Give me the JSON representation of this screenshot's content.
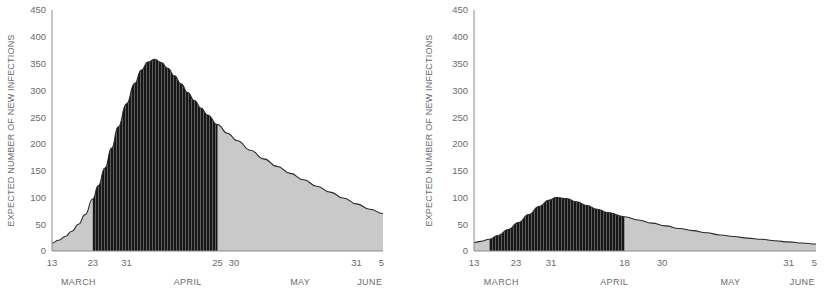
{
  "figure": {
    "panel_count": 2,
    "colors": {
      "light_fill": "#c9c9c9",
      "dark_fill": "#1e1e1e",
      "curve_stroke": "#2b2b2b",
      "axis_stroke": "#8a8a8a",
      "text": "#6b6b6b",
      "background": "#ffffff"
    }
  },
  "chart_data": [
    {
      "id": "left-panel",
      "type": "area",
      "title": "",
      "xlabel": "",
      "ylabel": "EXPECTED NUMBER OF NEW INFECTIONS",
      "ylim": [
        0,
        450
      ],
      "yticks": [
        0,
        50,
        100,
        150,
        200,
        250,
        300,
        350,
        400,
        450
      ],
      "ytick_labels": [
        "0",
        "50",
        "100",
        "150",
        "200",
        "250",
        "300",
        "350",
        "400",
        "450"
      ],
      "grid": false,
      "legend": "none",
      "xlim": [
        0,
        100
      ],
      "xticks": [
        0,
        12.3,
        22.5,
        50.0,
        55.0,
        92.0,
        99.5
      ],
      "xtick_labels": [
        "13",
        "23",
        "31",
        "25",
        "30",
        "31",
        "5"
      ],
      "month_bands": [
        {
          "label": "MARCH",
          "center": 8.0
        },
        {
          "label": "APRIL",
          "center": 41.0
        },
        {
          "label": "MAY",
          "center": 75.0
        },
        {
          "label": "JUNE",
          "center": 96.0
        }
      ],
      "shaded_interval": {
        "start": 12.3,
        "end": 50.0,
        "style": "dark-striped"
      },
      "peak": {
        "x": 31.0,
        "y": 358
      },
      "x": [
        0,
        2,
        4,
        6,
        8,
        10,
        12.3,
        14,
        16,
        18,
        20,
        22.5,
        25,
        27,
        29,
        31,
        33,
        35,
        37,
        39,
        41,
        43,
        45,
        47,
        50,
        53,
        56,
        60,
        64,
        68,
        72,
        76,
        80,
        84,
        88,
        92,
        96,
        100
      ],
      "y": [
        15,
        20,
        27,
        37,
        50,
        68,
        97,
        122,
        155,
        192,
        232,
        275,
        313,
        338,
        353,
        358,
        352,
        341,
        327,
        312,
        296,
        281,
        267,
        254,
        236,
        220,
        206,
        188,
        172,
        158,
        145,
        133,
        121,
        110,
        99,
        88,
        78,
        70
      ]
    },
    {
      "id": "right-panel",
      "type": "area",
      "title": "",
      "xlabel": "",
      "ylabel": "EXPECTED NUMBER OF NEW INFECTIONS",
      "ylim": [
        0,
        450
      ],
      "yticks": [
        0,
        50,
        100,
        150,
        200,
        250,
        300,
        350,
        400,
        450
      ],
      "ytick_labels": [
        "0",
        "50",
        "100",
        "150",
        "200",
        "250",
        "300",
        "350",
        "400",
        "450"
      ],
      "grid": false,
      "legend": "none",
      "xlim": [
        0,
        100
      ],
      "xticks": [
        0,
        12.3,
        22.5,
        44.0,
        55.0,
        92.0,
        99.5
      ],
      "xtick_labels": [
        "13",
        "23",
        "31",
        "18",
        "30",
        "31",
        "5"
      ],
      "month_bands": [
        {
          "label": "MARCH",
          "center": 8.0
        },
        {
          "label": "APRIL",
          "center": 41.0
        },
        {
          "label": "MAY",
          "center": 75.0
        },
        {
          "label": "JUNE",
          "center": 96.0
        }
      ],
      "shaded_interval": {
        "start": 4.5,
        "end": 44.0,
        "style": "dark-striped"
      },
      "peak": {
        "x": 24.0,
        "y": 100
      },
      "x": [
        0,
        2,
        4.5,
        7,
        10,
        13,
        16,
        19,
        22,
        24,
        27,
        30,
        33,
        36,
        39,
        44,
        48,
        52,
        56,
        60,
        64,
        68,
        72,
        76,
        80,
        84,
        88,
        92,
        96,
        100
      ],
      "y": [
        16,
        18,
        22,
        29,
        40,
        53,
        68,
        83,
        95,
        100,
        98,
        92,
        85,
        78,
        72,
        64,
        58,
        52,
        47,
        42,
        38,
        34,
        30,
        27,
        24,
        22,
        19,
        17,
        15,
        13
      ]
    }
  ]
}
